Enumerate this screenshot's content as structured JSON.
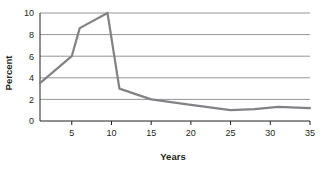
{
  "chart_data": {
    "type": "line",
    "title": "",
    "xlabel": "Years",
    "ylabel": "Percent",
    "xlim": [
      1,
      35
    ],
    "ylim": [
      0,
      10
    ],
    "grid": true,
    "legend": false,
    "line_color": "#808285",
    "axis_color": "#231f20",
    "grid_color": "#939598",
    "background": "#ffffff",
    "xticks": [
      5,
      10,
      15,
      20,
      25,
      30,
      35
    ],
    "xtick_labels": [
      "5",
      "10",
      "15",
      "20",
      "25",
      "30",
      "35"
    ],
    "yticks": [
      0,
      2,
      4,
      6,
      8,
      10
    ],
    "ytick_labels": [
      "0",
      "2",
      "4",
      "6",
      "8",
      "10"
    ],
    "series": [
      {
        "name": "Percent",
        "x": [
          1,
          5,
          6,
          9.5,
          11,
          15,
          20,
          25,
          28,
          31,
          35
        ],
        "y": [
          3.5,
          6.0,
          8.6,
          10.0,
          3.0,
          2.0,
          1.5,
          1.0,
          1.1,
          1.3,
          1.2
        ]
      }
    ]
  }
}
